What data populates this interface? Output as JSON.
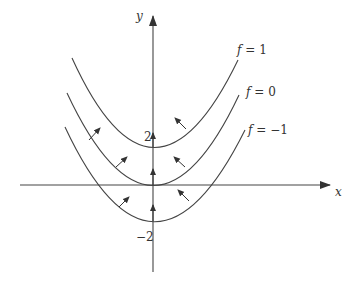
{
  "diagram": {
    "type": "level-curves",
    "axes": {
      "x_label": "x",
      "y_label": "y",
      "y_ticks": [
        {
          "value": 2,
          "label": "2"
        },
        {
          "value": -2,
          "label": "−2"
        }
      ]
    },
    "curves": [
      {
        "name": "f = 1",
        "label_f": "f",
        "label_eq": " = 1",
        "vertex_y": 2
      },
      {
        "name": "f = 0",
        "label_f": "f",
        "label_eq": " = 0",
        "vertex_y": 0
      },
      {
        "name": "f = -1",
        "label_f": "f",
        "label_eq": " = −1",
        "vertex_y": -2
      }
    ],
    "gradient_arrows_note": "Arrows point normal to level curves toward increasing f",
    "colors": {
      "line": "#444444",
      "text": "#333333"
    }
  }
}
